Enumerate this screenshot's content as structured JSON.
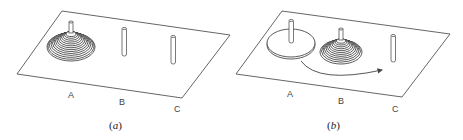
{
  "figure": {
    "panels": [
      {
        "id": "a",
        "caption_letter": "a",
        "peg_labels": [
          "A",
          "B",
          "C"
        ],
        "state": "all disks stacked on peg A"
      },
      {
        "id": "b",
        "caption_letter": "b",
        "peg_labels": [
          "A",
          "B",
          "C"
        ],
        "state": "largest disk remains on A, remaining disks moved to B, arrow indicates moving largest disk from A to C"
      }
    ]
  },
  "labels": {
    "a": {
      "A": "A",
      "B": "B",
      "C": "C",
      "caption_open": "(",
      "caption_letter": "a",
      "caption_close": ")"
    },
    "b": {
      "A": "A",
      "B": "B",
      "C": "C",
      "caption_open": "(",
      "caption_letter": "b",
      "caption_close": ")"
    }
  },
  "colors": {
    "line": "#555555",
    "disk_stroke": "#333333",
    "background": "#ffffff"
  }
}
